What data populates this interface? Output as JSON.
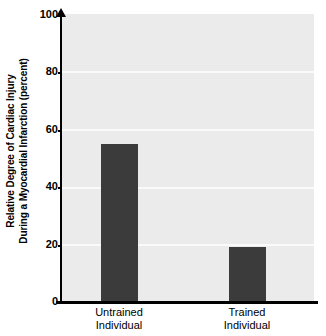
{
  "chart_data": {
    "type": "bar",
    "title": "",
    "subtitle": "",
    "xlabel": "",
    "ylabel": "Relative Degree of Cardiac Injury During a Myocardial Infarction (percent)",
    "ylabel_lines": [
      "Relative Degree of Cardiac Injury",
      "During a Myocardial Infarction (percent)"
    ],
    "categories": [
      "Untrained Individual",
      "Trained Individual"
    ],
    "category_lines": [
      [
        "Untrained",
        "Individual"
      ],
      [
        "Trained",
        "Individual"
      ]
    ],
    "values": [
      55,
      19
    ],
    "ylim": [
      0,
      100
    ],
    "yticks": [
      0,
      20,
      40,
      60,
      80,
      100
    ],
    "ytick_labels": [
      "0",
      "20",
      "40",
      "60",
      "80",
      "100"
    ],
    "grid": true,
    "grid_axis": "y",
    "legend": null,
    "legend_position": "none",
    "colors": {
      "bar": "#3b3b3b",
      "plot_background": "#ebebeb",
      "gridline": "#fafafa",
      "axis": "#000000",
      "text": "#000000",
      "figure_background": "#ffffff"
    }
  }
}
